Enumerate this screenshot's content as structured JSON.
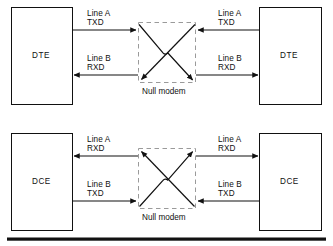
{
  "figure": {
    "kind": "null-modem-wiring-diagram",
    "stroke_color": "#111111",
    "dash_color": "#8a8a8a",
    "background": "#ffffff"
  },
  "diagrams": [
    {
      "id": "dte-pair",
      "left_box_label": "DTE",
      "right_box_label": "DTE",
      "null_modem_label": "Null modem",
      "signals": [
        {
          "id": "top-left",
          "line_label": "Line A",
          "signal_label": "TXD",
          "direction": "right"
        },
        {
          "id": "top-right",
          "line_label": "Line A",
          "signal_label": "TXD",
          "direction": "left"
        },
        {
          "id": "bottom-left",
          "line_label": "Line B",
          "signal_label": "RXD",
          "direction": "left"
        },
        {
          "id": "bottom-right",
          "line_label": "Line B",
          "signal_label": "RXD",
          "direction": "right"
        }
      ]
    },
    {
      "id": "dce-pair",
      "left_box_label": "DCE",
      "right_box_label": "DCE",
      "null_modem_label": "Null modem",
      "signals": [
        {
          "id": "top-left",
          "line_label": "Line A",
          "signal_label": "RXD",
          "direction": "left"
        },
        {
          "id": "top-right",
          "line_label": "Line A",
          "signal_label": "RXD",
          "direction": "right"
        },
        {
          "id": "bottom-left",
          "line_label": "Line B",
          "signal_label": "TXD",
          "direction": "right"
        },
        {
          "id": "bottom-right",
          "line_label": "Line B",
          "signal_label": "TXD",
          "direction": "left"
        }
      ]
    }
  ]
}
